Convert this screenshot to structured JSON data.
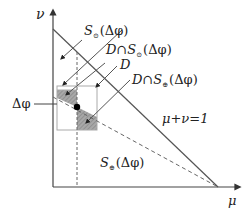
{
  "diagram": {
    "axes": {
      "y_label": "ν",
      "x_label": "μ"
    },
    "labels": {
      "s_circle": {
        "S": "S",
        "sub": "⊙",
        "arg": "(Δφ)"
      },
      "d_cap_s_circle": {
        "pre": "D∩",
        "S": "S",
        "sub": "⊙",
        "arg": "(Δφ)"
      },
      "d": "D",
      "d_cap_s_plus": {
        "pre": "D∩",
        "S": "S",
        "sub": "⊕",
        "arg": "(Δφ)"
      },
      "delta_phi": "Δφ",
      "line_eq": "μ+ν=1",
      "s_plus_region": {
        "S": "S",
        "sub": "⊕",
        "arg": "(Δφ)"
      }
    },
    "colors": {
      "line": "#555555",
      "shade": "#9a9a9a",
      "box": "#aaaaaa",
      "dot": "#000000"
    }
  }
}
